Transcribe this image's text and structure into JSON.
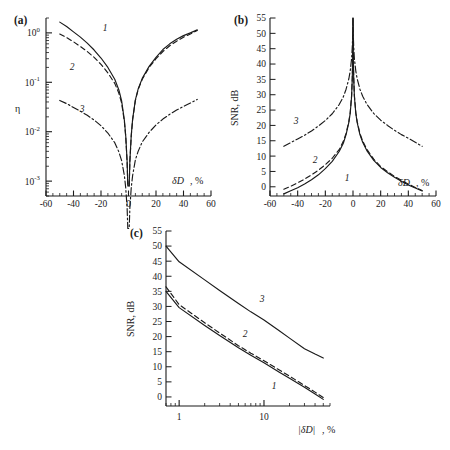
{
  "figure": {
    "panels": [
      "a",
      "b",
      "c"
    ],
    "curve_ids": [
      "1",
      "2",
      "3"
    ],
    "line_styles": [
      "solid",
      "dashed",
      "dash-dot"
    ]
  },
  "panel_a": {
    "tag": "(a)",
    "ylabel": "η",
    "xlabel_main": "δD",
    "xlabel_unit": ", %",
    "ytick_labels": [
      "10",
      "10",
      "10",
      "10"
    ],
    "ytick_exps": [
      "0",
      "-1",
      "-2",
      "-3"
    ],
    "xtick_labels": [
      "-60",
      "-40",
      "-20",
      "0",
      "20",
      "40",
      "60"
    ],
    "curve_labels": [
      "1",
      "2",
      "3"
    ]
  },
  "panel_b": {
    "tag": "(b)",
    "ylabel": "SNR, dB",
    "xlabel_main": "δD",
    "xlabel_unit": ", %",
    "ytick_labels": [
      "0",
      "5",
      "10",
      "15",
      "20",
      "25",
      "30",
      "35",
      "40",
      "45",
      "50",
      "55"
    ],
    "xtick_labels": [
      "-60",
      "-40",
      "-20",
      "0",
      "20",
      "40",
      "60"
    ],
    "curve_labels": [
      "1",
      "2",
      "3"
    ]
  },
  "panel_c": {
    "tag": "(c)",
    "ylabel": "SNR, dB",
    "xlabel_main": "|δD|",
    "xlabel_unit": ", %",
    "ytick_labels": [
      "0",
      "5",
      "10",
      "15",
      "20",
      "25",
      "30",
      "35",
      "40",
      "45",
      "50",
      "55"
    ],
    "xtick_labels": [
      "1",
      "10"
    ],
    "curve_labels": [
      "1",
      "2",
      "3"
    ]
  },
  "chart_data": [
    {
      "type": "line",
      "panel": "a",
      "title": "(a)",
      "xlabel": "δD, %",
      "ylabel": "η",
      "yscale": "log",
      "xlim": [
        -60,
        60
      ],
      "ylim": [
        0.0005,
        2.0
      ],
      "xticks": [
        -60,
        -40,
        -20,
        0,
        20,
        40,
        60
      ],
      "yticks": [
        0.001,
        0.01,
        0.1,
        1
      ],
      "grid": false,
      "legend": "inline-labels",
      "series": [
        {
          "name": "1",
          "style": "solid",
          "x": [
            -50,
            -45,
            -40,
            -35,
            -30,
            -25,
            -20,
            -15,
            -10,
            -7,
            -5,
            -3,
            -2,
            -1,
            -0.5,
            0.5,
            1,
            2,
            3,
            5,
            7,
            10,
            15,
            20,
            25,
            30,
            35,
            40,
            45,
            50
          ],
          "y": [
            1.65,
            1.35,
            1.05,
            0.82,
            0.62,
            0.45,
            0.31,
            0.2,
            0.115,
            0.07,
            0.042,
            0.017,
            0.0082,
            0.0025,
            0.0008,
            0.0008,
            0.0026,
            0.0085,
            0.018,
            0.044,
            0.073,
            0.12,
            0.21,
            0.32,
            0.46,
            0.6,
            0.74,
            0.88,
            1.0,
            1.15
          ]
        },
        {
          "name": "2",
          "style": "dashed",
          "x": [
            -50,
            -45,
            -40,
            -35,
            -30,
            -25,
            -20,
            -15,
            -10,
            -7,
            -5,
            -3,
            -2,
            -1,
            -0.5,
            0.5,
            1,
            2,
            3,
            5,
            7,
            10,
            15,
            20,
            25,
            30,
            35,
            40,
            45,
            50
          ],
          "y": [
            0.95,
            0.8,
            0.66,
            0.53,
            0.42,
            0.32,
            0.23,
            0.155,
            0.095,
            0.06,
            0.038,
            0.016,
            0.0078,
            0.0024,
            0.0008,
            0.0008,
            0.0025,
            0.0082,
            0.0175,
            0.043,
            0.071,
            0.115,
            0.2,
            0.3,
            0.42,
            0.55,
            0.68,
            0.82,
            0.95,
            1.12
          ]
        },
        {
          "name": "3",
          "style": "dash-dot",
          "x": [
            -50,
            -45,
            -40,
            -35,
            -30,
            -25,
            -20,
            -15,
            -10,
            -7,
            -5,
            -3,
            -2,
            -1,
            -0.5,
            0.5,
            1,
            2,
            3,
            5,
            7,
            10,
            15,
            20,
            25,
            30,
            35,
            40,
            45,
            50
          ],
          "y": [
            0.043,
            0.037,
            0.031,
            0.026,
            0.0215,
            0.0172,
            0.0132,
            0.0094,
            0.006,
            0.0039,
            0.0026,
            0.0013,
            0.00072,
            0.00028,
            0.00011,
            0.00011,
            0.00029,
            0.00074,
            0.0013,
            0.0027,
            0.004,
            0.0062,
            0.0097,
            0.0137,
            0.018,
            0.0225,
            0.0275,
            0.0325,
            0.038,
            0.045
          ]
        }
      ]
    },
    {
      "type": "line",
      "panel": "b",
      "title": "(b)",
      "xlabel": "δD, %",
      "ylabel": "SNR, dB",
      "yscale": "linear",
      "xlim": [
        -60,
        60
      ],
      "ylim": [
        -3,
        55
      ],
      "xticks": [
        -60,
        -40,
        -20,
        0,
        20,
        40,
        60
      ],
      "yticks": [
        0,
        5,
        10,
        15,
        20,
        25,
        30,
        35,
        40,
        45,
        50,
        55
      ],
      "grid": false,
      "legend": "inline-labels",
      "series": [
        {
          "name": "1",
          "style": "solid",
          "x": [
            -50,
            -45,
            -40,
            -35,
            -30,
            -25,
            -20,
            -15,
            -10,
            -7,
            -5,
            -3,
            -2,
            -1,
            -0.5,
            -0.2,
            0,
            0.2,
            0.5,
            1,
            2,
            3,
            5,
            7,
            10,
            15,
            20,
            25,
            30,
            35,
            40,
            45,
            50
          ],
          "y": [
            -2.3,
            -1.3,
            -0.3,
            0.9,
            2.3,
            3.9,
            5.9,
            8.3,
            11.5,
            14.2,
            17.0,
            21.0,
            24.0,
            29.5,
            35.5,
            43.0,
            55.0,
            43.0,
            35.5,
            29.5,
            24.0,
            21.0,
            17.0,
            14.5,
            11.8,
            8.6,
            6.3,
            4.6,
            3.1,
            1.8,
            0.6,
            -0.4,
            -1.4
          ]
        },
        {
          "name": "2",
          "style": "dashed",
          "x": [
            -50,
            -45,
            -40,
            -35,
            -30,
            -25,
            -20,
            -15,
            -10,
            -7,
            -5,
            -3,
            -2,
            -1,
            -0.5,
            -0.2,
            0,
            0.2,
            0.5,
            1,
            2,
            3,
            5,
            7,
            10,
            15,
            20,
            25,
            30,
            35,
            40,
            45,
            50
          ],
          "y": [
            -0.8,
            0.2,
            1.3,
            2.5,
            3.9,
            5.4,
            7.2,
            9.3,
            12.1,
            14.8,
            17.4,
            21.3,
            24.3,
            29.8,
            35.8,
            43.2,
            55.0,
            43.2,
            35.8,
            29.8,
            24.3,
            21.3,
            17.4,
            14.9,
            12.2,
            9.0,
            6.6,
            4.9,
            3.4,
            2.1,
            0.9,
            -0.2,
            -1.2
          ]
        },
        {
          "name": "3",
          "style": "dash-dot",
          "x": [
            -50,
            -45,
            -40,
            -35,
            -30,
            -25,
            -20,
            -15,
            -10,
            -7,
            -5,
            -3,
            -2,
            -1,
            -0.5,
            -0.2,
            0,
            0.2,
            0.5,
            1,
            2,
            3,
            5,
            7,
            10,
            15,
            20,
            25,
            30,
            35,
            40,
            45,
            50
          ],
          "y": [
            13.2,
            14.4,
            15.6,
            16.8,
            18.2,
            19.8,
            21.6,
            23.8,
            26.8,
            29.3,
            31.8,
            35.2,
            37.8,
            41.8,
            45.8,
            49.5,
            55.0,
            49.5,
            45.8,
            41.8,
            37.8,
            35.2,
            31.8,
            29.5,
            26.9,
            23.9,
            21.7,
            20.0,
            18.4,
            17.0,
            15.8,
            14.5,
            13.2
          ]
        }
      ]
    },
    {
      "type": "line",
      "panel": "c",
      "title": "(c)",
      "xlabel": "|δD|, %",
      "ylabel": "SNR, dB",
      "xscale": "log",
      "yscale": "linear",
      "xlim": [
        0.7,
        60
      ],
      "ylim": [
        -3,
        55
      ],
      "xticks": [
        1,
        10
      ],
      "yticks": [
        0,
        5,
        10,
        15,
        20,
        25,
        30,
        35,
        40,
        45,
        50,
        55
      ],
      "grid": false,
      "legend": "inline-labels",
      "series": [
        {
          "name": "1",
          "style": "solid",
          "x": [
            0.7,
            1,
            2,
            3,
            5,
            7,
            10,
            15,
            20,
            30,
            40,
            50
          ],
          "y": [
            35.0,
            29.6,
            23.7,
            20.4,
            16.3,
            13.8,
            11.3,
            8.3,
            6.2,
            3.2,
            1.0,
            -0.8
          ]
        },
        {
          "name": "2",
          "style": "dashed",
          "x": [
            0.7,
            1,
            2,
            3,
            5,
            7,
            10,
            15,
            20,
            30,
            40,
            50
          ],
          "y": [
            36.5,
            30.6,
            24.6,
            21.2,
            17.0,
            14.5,
            12.0,
            9.0,
            6.9,
            3.8,
            1.6,
            -0.2
          ]
        },
        {
          "name": "3",
          "style": "solid",
          "x": [
            0.7,
            1,
            2,
            3,
            5,
            7,
            10,
            15,
            20,
            30,
            40,
            50
          ],
          "y": [
            50.0,
            44.8,
            38.8,
            35.3,
            31.0,
            28.2,
            25.5,
            22.0,
            19.5,
            16.0,
            14.2,
            12.9
          ]
        }
      ]
    }
  ]
}
